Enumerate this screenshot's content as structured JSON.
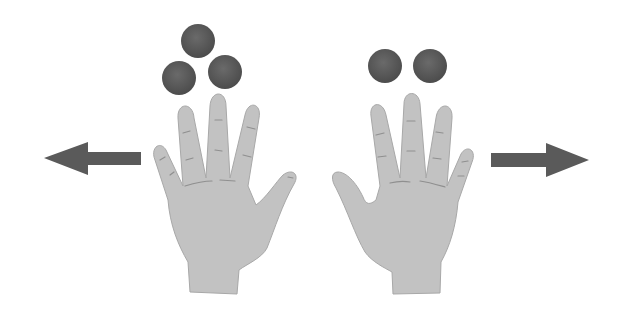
{
  "scene": {
    "description": "Two open hands; three balls above the left hand, two balls above the right hand; arrows pointing outward left and right",
    "colors": {
      "background": "#ffffff",
      "hand": "#c2c2c2",
      "hand_edge": "#a8a8a8",
      "crease": "#8f8f8f",
      "ball": "#555555",
      "ball_highlight": "#6e6e6e",
      "arrow": "#5a5a5a"
    }
  },
  "left_group": {
    "ball_count": 3,
    "arrow_direction": "left",
    "hand": "right-hand palm view (thumb on right)"
  },
  "right_group": {
    "ball_count": 2,
    "arrow_direction": "right",
    "hand": "left-hand palm view (thumb on left)"
  },
  "icons": {
    "left_arrow": "arrow-left-icon",
    "right_arrow": "arrow-right-icon",
    "ball": "ball-icon",
    "hand": "hand-icon"
  }
}
